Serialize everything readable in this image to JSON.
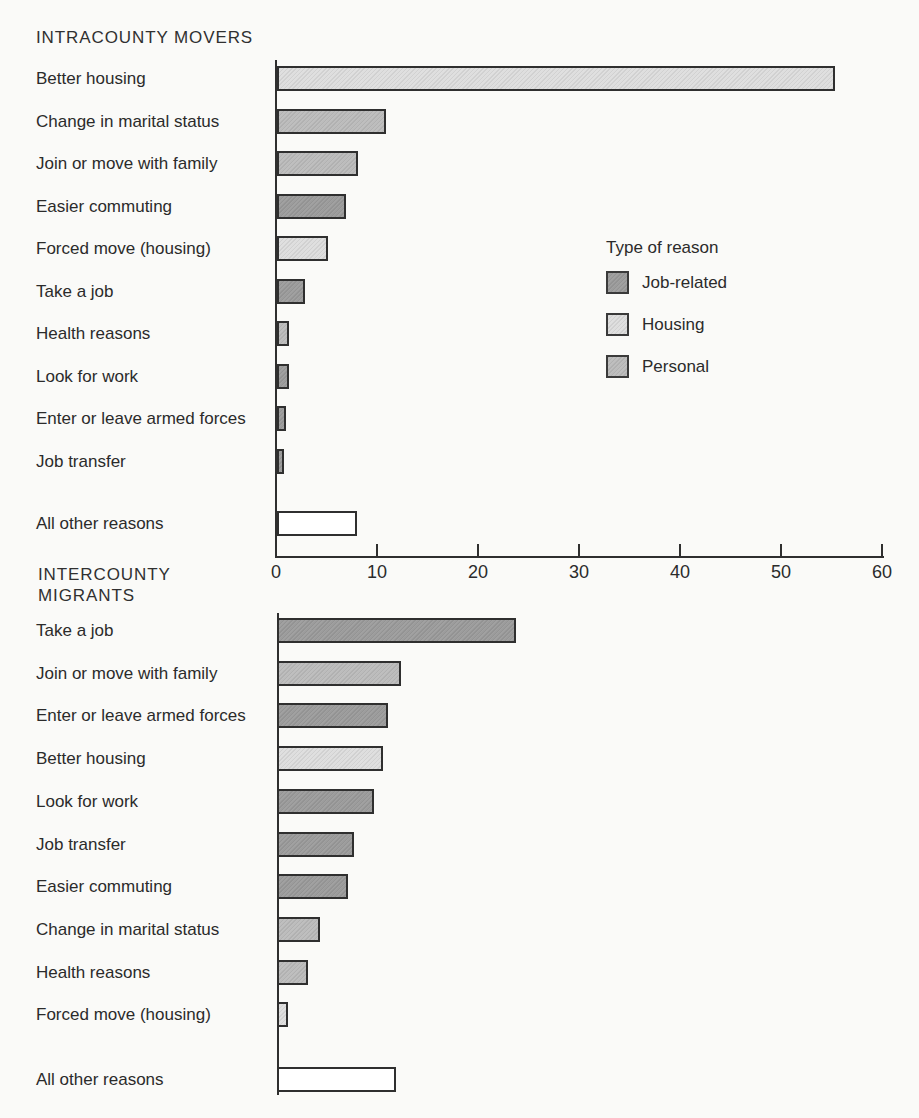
{
  "colors": {
    "job_related": "#9c9c9c",
    "housing": "#dedede",
    "personal": "#bcbcbc",
    "other": "#ffffff",
    "bar_border": "#2f2f2f",
    "axis_line": "#2f2f2f",
    "text": "#2b2b2b",
    "background": "#fafaf8"
  },
  "legend": {
    "title": "Type of reason",
    "items": [
      {
        "label": "Job-related",
        "type": "job_related"
      },
      {
        "label": "Housing",
        "type": "housing"
      },
      {
        "label": "Personal",
        "type": "personal"
      }
    ]
  },
  "axis": {
    "min": 0,
    "max": 60,
    "ticks": [
      "0",
      "10",
      "20",
      "30",
      "40",
      "50",
      "60"
    ]
  },
  "chart_data": [
    {
      "type": "bar",
      "orientation": "horizontal",
      "title": "INTRACOUNTY MOVERS",
      "xlabel": "",
      "xlim": [
        0,
        60
      ],
      "grid": false,
      "legend_position": "right-middle",
      "bars": [
        {
          "label": "Better housing",
          "value": 55.2,
          "reason_type": "housing"
        },
        {
          "label": "Change in marital status",
          "value": 10.8,
          "reason_type": "personal"
        },
        {
          "label": "Join or move with family",
          "value": 8.0,
          "reason_type": "personal"
        },
        {
          "label": "Easier commuting",
          "value": 6.8,
          "reason_type": "job_related"
        },
        {
          "label": "Forced move (housing)",
          "value": 5.0,
          "reason_type": "housing"
        },
        {
          "label": "Take a job",
          "value": 2.8,
          "reason_type": "job_related"
        },
        {
          "label": "Health reasons",
          "value": 1.2,
          "reason_type": "personal"
        },
        {
          "label": "Look for work",
          "value": 1.2,
          "reason_type": "job_related"
        },
        {
          "label": "Enter or leave armed forces",
          "value": 0.9,
          "reason_type": "job_related"
        },
        {
          "label": "Job transfer",
          "value": 0.7,
          "reason_type": "job_related"
        },
        {
          "label": "All other reasons",
          "value": 7.9,
          "reason_type": "other"
        }
      ]
    },
    {
      "type": "bar",
      "orientation": "horizontal",
      "title": "INTERCOUNTY\nMIGRANTS",
      "xlabel": "",
      "xlim": [
        0,
        60
      ],
      "grid": false,
      "bars": [
        {
          "label": "Take a job",
          "value": 23.7,
          "reason_type": "job_related"
        },
        {
          "label": "Join or move with family",
          "value": 12.3,
          "reason_type": "personal"
        },
        {
          "label": "Enter or leave armed forces",
          "value": 11.0,
          "reason_type": "job_related"
        },
        {
          "label": "Better housing",
          "value": 10.5,
          "reason_type": "housing"
        },
        {
          "label": "Look for work",
          "value": 9.6,
          "reason_type": "job_related"
        },
        {
          "label": "Job transfer",
          "value": 7.6,
          "reason_type": "job_related"
        },
        {
          "label": "Easier commuting",
          "value": 7.0,
          "reason_type": "job_related"
        },
        {
          "label": "Change in marital status",
          "value": 4.3,
          "reason_type": "personal"
        },
        {
          "label": "Health reasons",
          "value": 3.1,
          "reason_type": "personal"
        },
        {
          "label": "Forced move (housing)",
          "value": 1.1,
          "reason_type": "housing"
        },
        {
          "label": "All other reasons",
          "value": 11.8,
          "reason_type": "other"
        }
      ]
    }
  ]
}
